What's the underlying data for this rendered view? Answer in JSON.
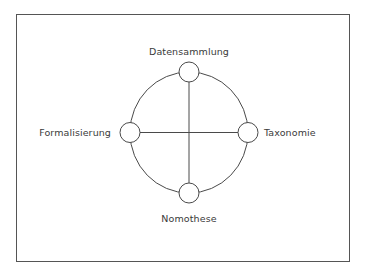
{
  "diagram": {
    "type": "cycle-with-cross",
    "frame": {
      "x": 16,
      "y": 14,
      "width": 333,
      "height": 247
    },
    "center": {
      "x": 189,
      "y": 132
    },
    "ellipse": {
      "rx": 60,
      "ry": 61
    },
    "node_radius": 10,
    "colors": {
      "stroke": "#4a4a4a",
      "frame": "#555555",
      "node_fill": "#ffffff",
      "text": "#3a3a3a",
      "background": "#ffffff"
    },
    "nodes": [
      {
        "id": "top",
        "label": "Datensammlung",
        "cx": 189,
        "cy": 72
      },
      {
        "id": "right",
        "label": "Taxonomie",
        "cx": 248,
        "cy": 132
      },
      {
        "id": "bottom",
        "label": "Nomothese",
        "cx": 189,
        "cy": 193
      },
      {
        "id": "left",
        "label": "Formalisierung",
        "cx": 130,
        "cy": 132
      }
    ],
    "edges": [
      {
        "from": "top",
        "to": "bottom",
        "kind": "axis"
      },
      {
        "from": "left",
        "to": "right",
        "kind": "axis"
      },
      {
        "from": "top",
        "to": "right",
        "kind": "arc"
      },
      {
        "from": "right",
        "to": "bottom",
        "kind": "arc"
      },
      {
        "from": "bottom",
        "to": "left",
        "kind": "arc"
      },
      {
        "from": "left",
        "to": "top",
        "kind": "arc"
      }
    ]
  },
  "labels": {
    "top": "Datensammlung",
    "right": "Taxonomie",
    "bottom": "Nomothese",
    "left": "Formalisierung"
  }
}
